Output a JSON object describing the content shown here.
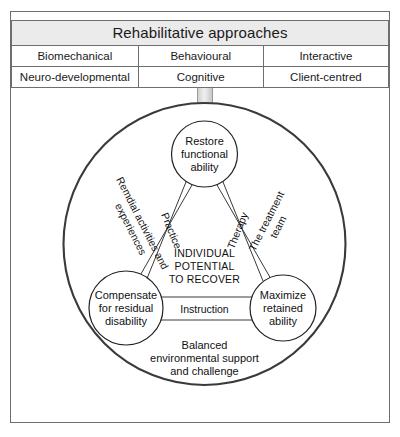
{
  "table": {
    "header": "Rehabilitative approaches",
    "rows": [
      [
        "Biomechanical",
        "Behavioural",
        "Interactive"
      ],
      [
        "Neuro-developmental",
        "Cognitive",
        "Client-centred"
      ]
    ]
  },
  "connector": {
    "name": "funnel-bar"
  },
  "diagram": {
    "center_label": [
      "INDIVIDUAL",
      "POTENTIAL",
      "TO RECOVER"
    ],
    "nodes": [
      {
        "id": "restore",
        "lines": [
          "Restore",
          "functional",
          "ability"
        ]
      },
      {
        "id": "compensate",
        "lines": [
          "Compensate",
          "for residual",
          "disability"
        ]
      },
      {
        "id": "maximize",
        "lines": [
          "Maximize",
          "retained",
          "ability"
        ]
      }
    ],
    "edge_labels": {
      "left": "Practice",
      "right": "Therapy",
      "bottom": "Instruction"
    },
    "outer_labels": {
      "left": [
        "Remdial activities and",
        "experiences"
      ],
      "right": [
        "The treatment",
        "team"
      ]
    },
    "footer": [
      "Balanced",
      "environmental support",
      "and challenge"
    ]
  },
  "colors": {
    "frame_stroke": "#6e6e6e",
    "header_fill": "#ebebeb",
    "circle_stroke": "#3a3a3a",
    "node_stroke": "#222222",
    "text": "#111111"
  }
}
